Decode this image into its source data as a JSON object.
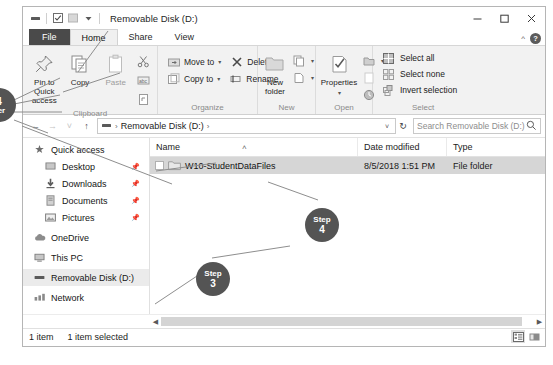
{
  "window": {
    "title": "Removable Disk (D:)",
    "controls": {
      "minimize": "minimize-button",
      "maximize": "maximize-button",
      "close": "close-button"
    },
    "quick_access_toolbar": [
      "removable-disk-icon",
      "properties-icon",
      "new-folder-icon",
      "customize-caret"
    ]
  },
  "ribbon": {
    "tabs": [
      {
        "label": "File",
        "state": "file"
      },
      {
        "label": "Home",
        "state": "active"
      },
      {
        "label": "Share",
        "state": "normal"
      },
      {
        "label": "View",
        "state": "normal"
      }
    ],
    "collapse_caret": "^",
    "help": "?",
    "groups": [
      {
        "name": "Clipboard",
        "buttons": [
          {
            "label": "Pin to Quick access",
            "icon": "pin-icon",
            "enabled": true
          },
          {
            "label": "Copy",
            "icon": "copy-icon",
            "enabled": true
          },
          {
            "label": "Paste",
            "icon": "paste-icon",
            "enabled": false
          }
        ],
        "small": [
          {
            "label": "Cut",
            "icon": "scissors-icon"
          },
          {
            "label": "Copy path",
            "icon": "copy-path-icon"
          },
          {
            "label": "Paste shortcut",
            "icon": "paste-shortcut-icon"
          }
        ]
      },
      {
        "name": "Organize",
        "small": [
          {
            "label": "Move to",
            "icon": "move-to-icon",
            "caret": "▾"
          },
          {
            "label": "Delete",
            "icon": "delete-x-icon",
            "caret": "▾"
          },
          {
            "label": "Copy to",
            "icon": "copy-to-icon",
            "caret": "▾"
          },
          {
            "label": "Rename",
            "icon": "rename-icon",
            "caret": ""
          }
        ]
      },
      {
        "name": "New",
        "buttons": [
          {
            "label": "New folder",
            "icon": "new-folder-icon",
            "enabled": true
          }
        ],
        "small": [
          {
            "label": "New item",
            "icon": "new-item-icon",
            "caret": "▾"
          },
          {
            "label": "Easy access",
            "icon": "easy-access-icon",
            "caret": "▾"
          }
        ]
      },
      {
        "name": "Open",
        "buttons": [
          {
            "label": "Properties",
            "icon": "properties-icon",
            "enabled": true,
            "caret": "▾"
          }
        ],
        "small": [
          {
            "label": "Open",
            "icon": "open-icon",
            "caret": "▾"
          },
          {
            "label": "Edit",
            "icon": "edit-icon",
            "caret": ""
          },
          {
            "label": "History",
            "icon": "history-icon",
            "caret": ""
          }
        ]
      },
      {
        "name": "Select",
        "items": [
          {
            "label": "Select all",
            "icon": "select-all-icon"
          },
          {
            "label": "Select none",
            "icon": "select-none-icon"
          },
          {
            "label": "Invert selection",
            "icon": "invert-selection-icon"
          }
        ]
      }
    ]
  },
  "address_bar": {
    "back": "←",
    "forward": "→",
    "recent": "˅",
    "up": "↑",
    "drive_icon": "removable-disk-icon",
    "breadcrumbs": [
      "Removable Disk (D:)"
    ],
    "breadcrumb_sep": "›",
    "dropdown_caret": "˅",
    "refresh": "↻",
    "search_placeholder": "Search Removable Disk (D:)",
    "search_value": "",
    "search_icon": "search-icon"
  },
  "nav_pane": {
    "items": [
      {
        "label": "Quick access",
        "icon": "quick-access-star-icon",
        "pinned": false,
        "indent": false,
        "selected": false
      },
      {
        "label": "Desktop",
        "icon": "desktop-icon",
        "pinned": true,
        "indent": true,
        "selected": false
      },
      {
        "label": "Downloads",
        "icon": "downloads-icon",
        "pinned": true,
        "indent": true,
        "selected": false
      },
      {
        "label": "Documents",
        "icon": "documents-icon",
        "pinned": true,
        "indent": true,
        "selected": false
      },
      {
        "label": "Pictures",
        "icon": "pictures-icon",
        "pinned": true,
        "indent": true,
        "selected": false
      },
      {
        "label": "OneDrive",
        "icon": "onedrive-cloud-icon",
        "pinned": false,
        "indent": false,
        "selected": false
      },
      {
        "label": "This PC",
        "icon": "this-pc-icon",
        "pinned": false,
        "indent": false,
        "selected": false
      },
      {
        "label": "Removable Disk (D:)",
        "icon": "removable-disk-icon",
        "pinned": false,
        "indent": false,
        "selected": true
      },
      {
        "label": "Network",
        "icon": "network-icon",
        "pinned": false,
        "indent": false,
        "selected": false
      }
    ],
    "pin_glyph": "📌"
  },
  "file_list": {
    "columns": [
      {
        "label": "Name",
        "sorted": true,
        "sort_glyph": "˄"
      },
      {
        "label": "Date modified",
        "sorted": false
      },
      {
        "label": "Type",
        "sorted": false
      }
    ],
    "rows": [
      {
        "name": "W10-StudentDataFiles",
        "date": "8/5/2018 1:51 PM",
        "type": "File folder",
        "icon": "folder-icon",
        "selected": true,
        "checked": false
      }
    ]
  },
  "status_bar": {
    "item_count": "1 item",
    "selection": "1 item selected",
    "view_buttons": [
      {
        "name": "details-view-button",
        "active": true
      },
      {
        "name": "large-icons-view-button",
        "active": false
      }
    ]
  },
  "callouts": [
    {
      "id": "step-3",
      "step_label": "Step",
      "number": "3",
      "x": 196,
      "y": 262,
      "size": 34
    },
    {
      "id": "step-4",
      "step_label": "Step",
      "number": "4",
      "x": 305,
      "y": 208,
      "size": 34
    },
    {
      "id": "step-4-left",
      "step_label": "",
      "number": "4",
      "x": -18,
      "y": 88,
      "size": 34
    }
  ],
  "colors": {
    "file_tab": "#4a4a4a",
    "ribbon_bg": "#f2f2f2",
    "selection": "#d6d6d6",
    "callout": "#545454",
    "nav_selected": "#ebebeb"
  }
}
